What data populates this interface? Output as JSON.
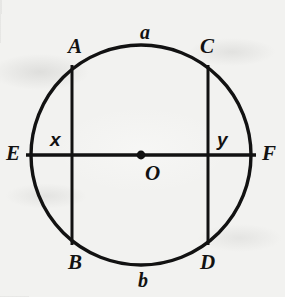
{
  "figure": {
    "kind": "circle-with-two-parallel-chords-and-diameter",
    "background_color": "#f2f2f0",
    "ink_color": "#121212",
    "circle": {
      "center_label": "O",
      "center_x": 141,
      "center_y": 155,
      "radius": 110,
      "stroke_width": 3.4
    },
    "center_dot": {
      "radius": 4.4
    },
    "diameter": {
      "name": "EF",
      "left_label": "E",
      "right_label": "F",
      "y": 155,
      "x_start": 26,
      "x_end": 256,
      "stroke_width": 3.4
    },
    "chords": [
      {
        "name": "AB",
        "top_label": "A",
        "bottom_label": "B",
        "x": 72,
        "y_top": 66,
        "y_bottom": 244,
        "stroke_width": 3.0
      },
      {
        "name": "CD",
        "top_label": "C",
        "bottom_label": "D",
        "x": 208,
        "y_top": 66,
        "y_bottom": 244,
        "stroke_width": 3.0
      }
    ],
    "labels": [
      {
        "id": "label-a",
        "text": "a",
        "x": 140,
        "y": 22,
        "style": "arc",
        "note": "arc between A and C (top)"
      },
      {
        "id": "label-A",
        "text": "A",
        "x": 68,
        "y": 36,
        "style": "point"
      },
      {
        "id": "label-C",
        "text": "C",
        "x": 200,
        "y": 36,
        "style": "point"
      },
      {
        "id": "label-E",
        "text": "E",
        "x": 6,
        "y": 143,
        "style": "point"
      },
      {
        "id": "label-x",
        "text": "x",
        "x": 50,
        "y": 130,
        "style": "var",
        "note": "segment from E to chord AB"
      },
      {
        "id": "label-y",
        "text": "y",
        "x": 217,
        "y": 130,
        "style": "var",
        "note": "segment from chord CD to F"
      },
      {
        "id": "label-F",
        "text": "F",
        "x": 262,
        "y": 143,
        "style": "point"
      },
      {
        "id": "label-O",
        "text": "O",
        "x": 145,
        "y": 163,
        "style": "point",
        "note": "center of circle"
      },
      {
        "id": "label-B",
        "text": "B",
        "x": 68,
        "y": 252,
        "style": "point"
      },
      {
        "id": "label-D",
        "text": "D",
        "x": 200,
        "y": 252,
        "style": "point"
      },
      {
        "id": "label-b",
        "text": "b",
        "x": 138,
        "y": 270,
        "style": "arc",
        "note": "arc between B and D (bottom)"
      }
    ]
  }
}
